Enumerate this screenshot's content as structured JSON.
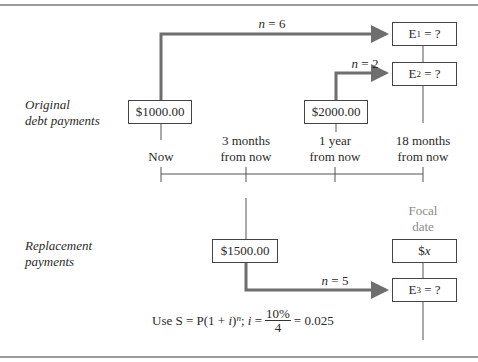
{
  "diagram": {
    "row_labels": {
      "original": [
        "Original",
        "debt payments"
      ],
      "replacement": [
        "Replacement",
        "payments"
      ]
    },
    "timeline": {
      "points": [
        {
          "label_line1": "Now",
          "label_line2": ""
        },
        {
          "label_line1": "3 months",
          "label_line2": "from now"
        },
        {
          "label_line1": "1 year",
          "label_line2": "from now"
        },
        {
          "label_line1": "18 months",
          "label_line2": "from now"
        }
      ]
    },
    "boxes": {
      "payment_1000": "$1000.00",
      "payment_2000": "$2000.00",
      "payment_1500": "$1500.00",
      "e1": {
        "base": "E",
        "sub": "1",
        "rest": " = ?"
      },
      "e2": {
        "base": "E",
        "sub": "2",
        "rest": " = ?"
      },
      "e3": {
        "base": "E",
        "sub": "3",
        "rest": " = ?"
      },
      "x_prefix": "$",
      "x_var": "x"
    },
    "arrows": {
      "n6": {
        "var": "n",
        "rest": " = 6"
      },
      "n2": {
        "var": "n",
        "rest": " = 2"
      },
      "n5": {
        "var": "n",
        "rest": " = 5"
      }
    },
    "focal_date": [
      "Focal",
      "date"
    ],
    "formula": {
      "prefix": "Use S = P(1 + ",
      "i_var": "i",
      "close": ")",
      "exponent": "n",
      "sep": "; ",
      "i_var2": "i",
      "equals": " =",
      "numerator": "10%",
      "denominator": "4",
      "result": "= 0.025"
    },
    "colors": {
      "arrow": "#6e6e6e",
      "line": "#555555",
      "box_border": "#444444",
      "focal_text": "#8c8c8c",
      "rule": "#9a9a9a"
    }
  }
}
